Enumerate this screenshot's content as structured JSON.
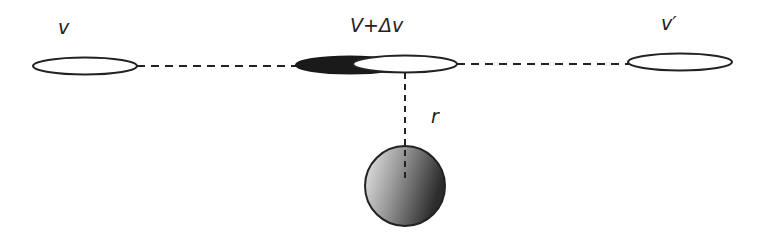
{
  "diagram": {
    "labels": {
      "left": "v",
      "center": "V+Δv",
      "right": "v′",
      "distance": "r"
    },
    "colors": {
      "stroke": "#222222",
      "filled_ellipse": "#1a1a1a",
      "sphere_light": "#e8e8e8",
      "sphere_dark": "#2a2a2a"
    }
  }
}
